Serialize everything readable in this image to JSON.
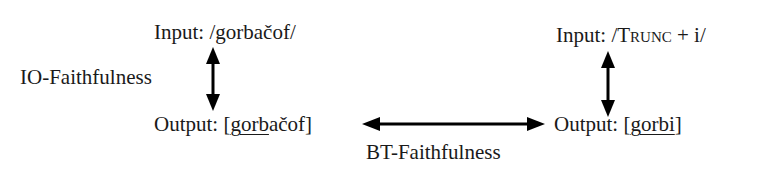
{
  "left": {
    "input": {
      "prefix": "Input: ",
      "form": "/gorbačof/"
    },
    "output": {
      "prefix": "Output: ",
      "open": "[",
      "underlined": "gorb",
      "rest": "ačof",
      "close": "]"
    },
    "relation_label": "IO-Faithfulness"
  },
  "right": {
    "input": {
      "prefix": "Input: ",
      "open": "/",
      "morpheme": "Trunc",
      "rest": " + i/"
    },
    "output": {
      "prefix": "Output: ",
      "open": "[",
      "underlined": "gorbi",
      "close": "]"
    }
  },
  "bottom_relation_label": "BT-Faithfulness",
  "colors": {
    "text": "#1a1a1a",
    "arrow": "#000000",
    "background": "#ffffff"
  }
}
